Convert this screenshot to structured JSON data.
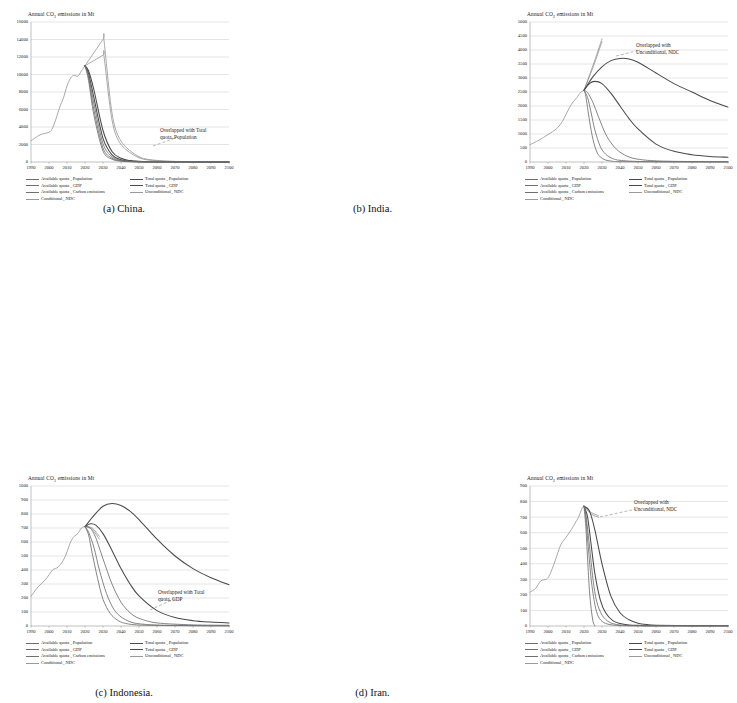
{
  "figure": {
    "axis_title": "Annual CO2 emissions in Mt",
    "axis_title_prefix": "Annual CO",
    "axis_title_sub": "2",
    "axis_title_suffix": " emissions in Mt",
    "line_color_dark": "#4a4a4a",
    "line_color_mid": "#6f6f6f",
    "line_color_light": "#9a9a9a",
    "grid_color": "#c8c8c8",
    "axis_color": "#808080"
  },
  "legend_labels": {
    "available_population": "Available quota , Population",
    "available_gdp": "Available quota , GDP",
    "available_carbon": "Available quota , Carbon emissions",
    "conditional_ndc": "Conditional , NDC",
    "total_population": "Total quota , Population",
    "total_gdp": "Total quota , GDP",
    "unconditional_ndc": "Unconditional , NDC"
  },
  "panels": [
    {
      "id": "china",
      "caption": "(a) China.",
      "annotation_line1": "Overlapped with Total",
      "annotation_line2": "quota, Population"
    },
    {
      "id": "india",
      "caption": "(b) India.",
      "annotation_line1": "Overlapped with",
      "annotation_line2": "Unconditional, NDC"
    },
    {
      "id": "indonesia",
      "caption": "(c) Indonesia.",
      "annotation_line1": "Overlapped with Total",
      "annotation_line2": "quota, GDP"
    },
    {
      "id": "iran",
      "caption": "(d) Iran.",
      "annotation_line1": "Overlapped with",
      "annotation_line2": "Unconditional, NDC"
    }
  ],
  "chart_data": [
    {
      "type": "line",
      "id": "china",
      "title": "(a) China.",
      "xlabel": "",
      "ylabel": "Annual CO2 emissions in Mt",
      "xlim": [
        1990,
        2100
      ],
      "ylim": [
        0,
        16000
      ],
      "ytick_step": 2000,
      "xtick_step": 10,
      "yticks": [
        0,
        2000,
        4000,
        6000,
        8000,
        10000,
        12000,
        14000,
        16000
      ],
      "xticks": [
        1990,
        2000,
        2010,
        2020,
        2030,
        2040,
        2050,
        2060,
        2070,
        2080,
        2090,
        2100
      ],
      "grid": true,
      "legend_position": "below-axes",
      "annotations": [
        "Overlapped with Total quota, Population"
      ],
      "series": [
        {
          "name": "Historical",
          "x": [
            1990,
            1995,
            2000,
            2002,
            2004,
            2006,
            2008,
            2010,
            2012,
            2014,
            2016,
            2018,
            2020
          ],
          "values": [
            2420,
            3100,
            3400,
            3900,
            5000,
            6300,
            7300,
            8700,
            9600,
            9900,
            9800,
            10400,
            11000
          ]
        },
        {
          "name": "Unconditional , NDC",
          "x": [
            2020,
            2030,
            2030.5,
            2035,
            2040,
            2050,
            2060,
            2070,
            2080,
            2090,
            2100
          ],
          "values": [
            11000,
            14000,
            14000,
            5600,
            2400,
            600,
            180,
            70,
            30,
            15,
            10
          ]
        },
        {
          "name": "Conditional , NDC",
          "x": [
            2020,
            2030,
            2030.5,
            2035,
            2040,
            2050,
            2060,
            2070,
            2080,
            2090,
            2100
          ],
          "values": [
            11000,
            12200,
            12200,
            4800,
            2000,
            480,
            140,
            55,
            25,
            12,
            8
          ]
        },
        {
          "name": "Total quota , Population",
          "x": [
            2020,
            2022,
            2025,
            2030,
            2035,
            2040,
            2045,
            2050,
            2060,
            2080,
            2100
          ],
          "values": [
            11000,
            10400,
            8200,
            3600,
            1200,
            420,
            160,
            70,
            20,
            6,
            3
          ]
        },
        {
          "name": "Total quota , GDP",
          "x": [
            2020,
            2022,
            2025,
            2030,
            2035,
            2040,
            2045,
            2050,
            2060,
            2080,
            2100
          ],
          "values": [
            11000,
            10100,
            7300,
            2700,
            820,
            270,
            100,
            45,
            14,
            4,
            2
          ]
        },
        {
          "name": "Available quota , Population",
          "x": [
            2020,
            2022,
            2025,
            2030,
            2035,
            2040,
            2045,
            2050,
            2060,
            2080,
            2100
          ],
          "values": [
            11000,
            9900,
            6600,
            2100,
            600,
            190,
            70,
            30,
            10,
            3,
            1
          ]
        },
        {
          "name": "Available quota , GDP",
          "x": [
            2020,
            2022,
            2025,
            2030,
            2035,
            2040,
            2045,
            2050,
            2060,
            2080,
            2100
          ],
          "values": [
            11000,
            9600,
            5900,
            1600,
            430,
            130,
            48,
            20,
            7,
            2,
            1
          ]
        },
        {
          "name": "Available quota , Carbon emissions",
          "x": [
            2020,
            2022,
            2025,
            2030,
            2035,
            2040,
            2045,
            2050,
            2060,
            2080,
            2100
          ],
          "values": [
            11000,
            9300,
            5300,
            1250,
            320,
            95,
            34,
            14,
            5,
            2,
            1
          ]
        }
      ]
    },
    {
      "type": "line",
      "id": "india",
      "title": "(b) India.",
      "xlabel": "",
      "ylabel": "Annual CO2 emissions in Mt",
      "xlim": [
        1990,
        2100
      ],
      "ylim": [
        0,
        5000
      ],
      "ytick_step": 500,
      "xtick_step": 10,
      "yticks": [
        0,
        500,
        1000,
        1500,
        2000,
        2500,
        3000,
        3500,
        4000,
        4500,
        5000
      ],
      "xticks": [
        1990,
        2000,
        2010,
        2020,
        2030,
        2040,
        2050,
        2060,
        2070,
        2080,
        2090,
        2100
      ],
      "grid": true,
      "legend_position": "below-axes",
      "annotations": [
        "Overlapped with Unconditional, NDC"
      ],
      "series": [
        {
          "name": "Historical",
          "x": [
            1990,
            1995,
            2000,
            2005,
            2008,
            2010,
            2012,
            2014,
            2016,
            2018,
            2020
          ],
          "values": [
            620,
            780,
            980,
            1200,
            1450,
            1700,
            1950,
            2150,
            2300,
            2480,
            2560
          ]
        },
        {
          "name": "Unconditional , NDC",
          "x": [
            2020,
            2025,
            2030
          ],
          "values": [
            2560,
            3450,
            4400
          ]
        },
        {
          "name": "Conditional , NDC",
          "x": [
            2020,
            2025,
            2030
          ],
          "values": [
            2560,
            3380,
            4300
          ]
        },
        {
          "name": "Total quota , Population",
          "x": [
            2020,
            2025,
            2030,
            2035,
            2040,
            2045,
            2050,
            2060,
            2070,
            2080,
            2090,
            2100
          ],
          "values": [
            2560,
            3050,
            3400,
            3620,
            3700,
            3680,
            3560,
            3180,
            2800,
            2500,
            2200,
            1960
          ]
        },
        {
          "name": "Total quota , GDP",
          "x": [
            2020,
            2023,
            2026,
            2030,
            2035,
            2040,
            2045,
            2050,
            2060,
            2070,
            2080,
            2090,
            2100
          ],
          "values": [
            2560,
            2800,
            2880,
            2800,
            2450,
            2000,
            1550,
            1180,
            640,
            380,
            260,
            200,
            170
          ]
        },
        {
          "name": "Available quota , Population",
          "x": [
            2020,
            2022,
            2025,
            2028,
            2032,
            2036,
            2040,
            2045,
            2050,
            2060,
            2080,
            2100
          ],
          "values": [
            2560,
            2480,
            2120,
            1620,
            1000,
            600,
            350,
            180,
            100,
            40,
            15,
            10
          ]
        },
        {
          "name": "Available quota , GDP",
          "x": [
            2020,
            2022,
            2024,
            2026,
            2029,
            2032,
            2036,
            2040,
            2050,
            2070,
            2100
          ],
          "values": [
            2560,
            2300,
            1750,
            1150,
            560,
            280,
            120,
            60,
            20,
            8,
            5
          ]
        },
        {
          "name": "Available quota , Carbon emissions",
          "x": [
            2020,
            2021,
            2023,
            2025,
            2027,
            2029,
            2032,
            2036,
            2040,
            2060,
            2100
          ],
          "values": [
            2560,
            2350,
            1500,
            800,
            380,
            180,
            70,
            25,
            12,
            4,
            2
          ]
        }
      ]
    },
    {
      "type": "line",
      "id": "indonesia",
      "title": "(c) Indonesia.",
      "xlabel": "",
      "ylabel": "Annual CO2 emissions in Mt",
      "xlim": [
        1990,
        2100
      ],
      "ylim": [
        0,
        1000
      ],
      "ytick_step": 100,
      "xtick_step": 10,
      "yticks": [
        0,
        100,
        200,
        300,
        400,
        500,
        600,
        700,
        800,
        900,
        1000
      ],
      "xticks": [
        1990,
        2000,
        2010,
        2020,
        2030,
        2040,
        2050,
        2060,
        2070,
        2080,
        2090,
        2100
      ],
      "grid": true,
      "legend_position": "below-axes",
      "annotations": [
        "Overlapped with Total quota, GDP"
      ],
      "series": [
        {
          "name": "Historical",
          "x": [
            1990,
            1994,
            1998,
            2002,
            2005,
            2008,
            2010,
            2012,
            2014,
            2016,
            2018,
            2020
          ],
          "values": [
            212,
            280,
            330,
            400,
            420,
            470,
            530,
            600,
            640,
            660,
            700,
            710
          ]
        },
        {
          "name": "Unconditional , NDC",
          "x": [
            2020,
            2024,
            2028
          ],
          "values": [
            710,
            700,
            640
          ]
        },
        {
          "name": "Conditional , NDC",
          "x": [
            2020,
            2024,
            2028
          ],
          "values": [
            710,
            690,
            620
          ]
        },
        {
          "name": "Total quota , Population",
          "x": [
            2020,
            2025,
            2030,
            2035,
            2040,
            2045,
            2050,
            2060,
            2070,
            2080,
            2090,
            2100
          ],
          "values": [
            710,
            790,
            855,
            875,
            860,
            820,
            760,
            620,
            500,
            410,
            345,
            295
          ]
        },
        {
          "name": "Total quota , GDP",
          "x": [
            2020,
            2023,
            2026,
            2030,
            2035,
            2040,
            2045,
            2050,
            2060,
            2070,
            2080,
            2090,
            2100
          ],
          "values": [
            710,
            730,
            720,
            660,
            540,
            410,
            300,
            215,
            110,
            60,
            38,
            28,
            22
          ]
        },
        {
          "name": "Available quota , Population",
          "x": [
            2020,
            2023,
            2026,
            2030,
            2035,
            2040,
            2045,
            2050,
            2060,
            2080,
            2100
          ],
          "values": [
            710,
            700,
            630,
            480,
            300,
            170,
            95,
            55,
            22,
            8,
            5
          ]
        },
        {
          "name": "Available quota , GDP",
          "x": [
            2020,
            2022,
            2025,
            2028,
            2032,
            2036,
            2040,
            2045,
            2050,
            2060,
            2080,
            2100
          ],
          "values": [
            710,
            670,
            560,
            400,
            230,
            120,
            65,
            30,
            16,
            7,
            3,
            2
          ]
        },
        {
          "name": "Available quota , Carbon emissions",
          "x": [
            2020,
            2022,
            2024,
            2027,
            2030,
            2034,
            2038,
            2042,
            2050,
            2070,
            2100
          ],
          "values": [
            710,
            650,
            520,
            340,
            190,
            90,
            42,
            20,
            7,
            3,
            1
          ]
        }
      ]
    },
    {
      "type": "line",
      "id": "iran",
      "title": "(d) Iran.",
      "xlabel": "",
      "ylabel": "Annual CO2 emissions in Mt",
      "xlim": [
        1990,
        2100
      ],
      "ylim": [
        0,
        900
      ],
      "ytick_step": 100,
      "xtick_step": 10,
      "yticks": [
        0,
        100,
        200,
        300,
        400,
        500,
        600,
        700,
        800,
        900
      ],
      "xticks": [
        1990,
        2000,
        2010,
        2020,
        2030,
        2040,
        2050,
        2060,
        2070,
        2080,
        2090,
        2100
      ],
      "grid": true,
      "legend_position": "below-axes",
      "annotations": [
        "Overlapped with Unconditional, NDC"
      ],
      "series": [
        {
          "name": "Historical",
          "x": [
            1990,
            1993,
            1996,
            1999,
            2001,
            2004,
            2007,
            2010,
            2013,
            2015,
            2017,
            2019,
            2020
          ],
          "values": [
            218,
            240,
            290,
            300,
            330,
            420,
            520,
            570,
            620,
            660,
            700,
            760,
            770
          ]
        },
        {
          "name": "Unconditional , NDC",
          "x": [
            2020,
            2024,
            2028
          ],
          "values": [
            770,
            730,
            710
          ]
        },
        {
          "name": "Conditional , NDC",
          "x": [
            2020,
            2024,
            2028
          ],
          "values": [
            770,
            720,
            700
          ]
        },
        {
          "name": "Total quota , Population",
          "x": [
            2020,
            2023,
            2026,
            2030,
            2035,
            2040,
            2045,
            2050,
            2055,
            2060,
            2080,
            2100
          ],
          "values": [
            770,
            740,
            620,
            400,
            190,
            85,
            40,
            18,
            9,
            5,
            2,
            1
          ]
        },
        {
          "name": "Total quota , GDP",
          "x": [
            2020,
            2022,
            2024,
            2026,
            2029,
            2032,
            2036,
            2040,
            2045,
            2050,
            2060,
            2100
          ],
          "values": [
            770,
            700,
            520,
            340,
            170,
            85,
            35,
            16,
            7,
            4,
            2,
            1
          ]
        },
        {
          "name": "Available quota , Population",
          "x": [
            2020,
            2021,
            2023,
            2025,
            2027,
            2030,
            2034,
            2038,
            2042,
            2050,
            2100
          ],
          "values": [
            770,
            720,
            520,
            300,
            160,
            70,
            25,
            10,
            5,
            2,
            1
          ]
        },
        {
          "name": "Available quota , GDP",
          "x": [
            2020,
            2021,
            2022,
            2024,
            2026,
            2028,
            2031,
            2035,
            2040,
            2050,
            2100
          ],
          "values": [
            770,
            700,
            560,
            300,
            140,
            60,
            22,
            8,
            3,
            1,
            1
          ]
        },
        {
          "name": "Available quota , Carbon emissions",
          "x": [
            2020,
            2021,
            2022,
            2023,
            2024,
            2025,
            2026
          ],
          "values": [
            770,
            640,
            430,
            230,
            110,
            30,
            0
          ]
        }
      ]
    }
  ]
}
